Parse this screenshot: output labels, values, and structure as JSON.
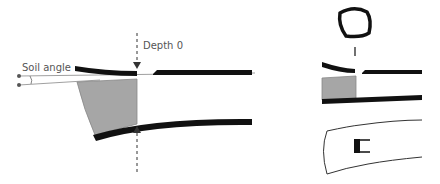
{
  "labels": {
    "soil_angle": "Soil angle",
    "depth_zero": "Depth 0"
  },
  "colors": {
    "stroke": "#111111",
    "soil_fill": "#a6a6a6",
    "thin_line": "#777777",
    "label_text": "#555555"
  },
  "panels": [
    {
      "name": "side-section-large",
      "description": "Longitudinal section with soil angle and depth 0 markers"
    },
    {
      "name": "cross-section-outline",
      "description": "Rounded quadrilateral cross-section"
    },
    {
      "name": "side-section-small",
      "description": "Smaller longitudinal section"
    },
    {
      "name": "plan-view",
      "description": "Top view outline with black marker"
    }
  ]
}
